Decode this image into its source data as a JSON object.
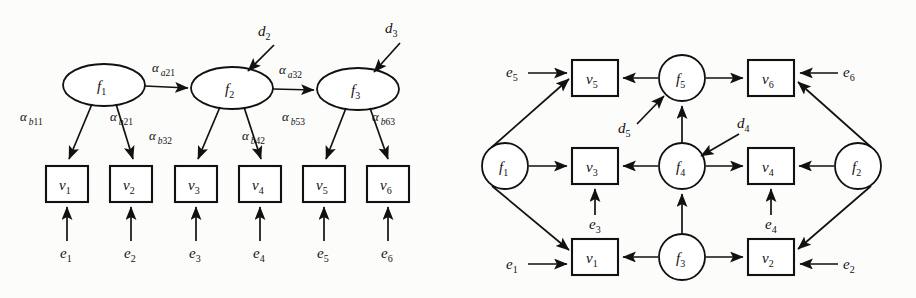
{
  "figure": {
    "background_color": "#fcfcfa",
    "stroke_color": "#111111",
    "node_fill": "#ffffff"
  },
  "left_panel": {
    "name": "factor-model-diagram",
    "latent_nodes": [
      {
        "id": "f1",
        "label": "f",
        "sub": "1",
        "shape": "ellipse",
        "cx": 104,
        "cy": 85,
        "rx": 41,
        "ry": 21
      },
      {
        "id": "f2",
        "label": "f",
        "sub": "2",
        "shape": "ellipse",
        "cx": 232,
        "cy": 88,
        "rx": 41,
        "ry": 21
      },
      {
        "id": "f3",
        "label": "f",
        "sub": "3",
        "shape": "ellipse",
        "cx": 358,
        "cy": 89,
        "rx": 41,
        "ry": 21
      }
    ],
    "observed_nodes": [
      {
        "id": "v1",
        "label": "v",
        "sub": "1",
        "shape": "rect",
        "x": 46,
        "y": 166,
        "w": 42,
        "h": 36
      },
      {
        "id": "v2",
        "label": "v",
        "sub": "2",
        "shape": "rect",
        "x": 110,
        "y": 166,
        "w": 42,
        "h": 36
      },
      {
        "id": "v3",
        "label": "v",
        "sub": "3",
        "shape": "rect",
        "x": 175,
        "y": 166,
        "w": 42,
        "h": 36
      },
      {
        "id": "v4",
        "label": "v",
        "sub": "4",
        "shape": "rect",
        "x": 239,
        "y": 166,
        "w": 42,
        "h": 36
      },
      {
        "id": "v5",
        "label": "v",
        "sub": "5",
        "shape": "rect",
        "x": 303,
        "y": 166,
        "w": 42,
        "h": 36
      },
      {
        "id": "v6",
        "label": "v",
        "sub": "6",
        "shape": "rect",
        "x": 367,
        "y": 166,
        "w": 42,
        "h": 36
      }
    ],
    "error_terms": [
      {
        "id": "e1",
        "label": "e",
        "sub": "1",
        "x": 67,
        "y": 258
      },
      {
        "id": "e2",
        "label": "e",
        "sub": "2",
        "x": 131,
        "y": 258
      },
      {
        "id": "e3",
        "label": "e",
        "sub": "3",
        "x": 196,
        "y": 258
      },
      {
        "id": "e4",
        "label": "e",
        "sub": "4",
        "x": 260,
        "y": 258
      },
      {
        "id": "e5",
        "label": "e",
        "sub": "5",
        "x": 324,
        "y": 258
      },
      {
        "id": "e6",
        "label": "e",
        "sub": "6",
        "x": 388,
        "y": 258
      }
    ],
    "disturbances": [
      {
        "id": "d2",
        "label": "d",
        "sub": "2",
        "x": 265,
        "y": 36
      },
      {
        "id": "d3",
        "label": "d",
        "sub": "3",
        "x": 392,
        "y": 33
      }
    ],
    "path_coefficients": [
      {
        "id": "a_a21",
        "symbol": "α",
        "sub_italic": "a",
        "sub_num": "21",
        "x": 160,
        "y": 72,
        "from": "f1",
        "to": "f2"
      },
      {
        "id": "a_a32",
        "symbol": "α",
        "sub_italic": "a",
        "sub_num": "32",
        "x": 287,
        "y": 74,
        "from": "f2",
        "to": "f3"
      },
      {
        "id": "a_b11",
        "symbol": "α",
        "sub_italic": "b",
        "sub_num": "11",
        "x": 28,
        "y": 121,
        "from": "f1",
        "to": "v1"
      },
      {
        "id": "a_b21",
        "symbol": "α",
        "sub_italic": "b",
        "sub_num": "21",
        "x": 118,
        "y": 121,
        "from": "f1",
        "to": "v2"
      },
      {
        "id": "a_b32",
        "symbol": "α",
        "sub_italic": "b",
        "sub_num": "32",
        "x": 157,
        "y": 140,
        "from": "f2",
        "to": "v3"
      },
      {
        "id": "a_b42",
        "symbol": "α",
        "sub_italic": "b",
        "sub_num": "42",
        "x": 250,
        "y": 140,
        "from": "f2",
        "to": "v4"
      },
      {
        "id": "a_b53",
        "symbol": "α",
        "sub_italic": "b",
        "sub_num": "53",
        "x": 290,
        "y": 121,
        "from": "f3",
        "to": "v5"
      },
      {
        "id": "a_b63",
        "symbol": "α",
        "sub_italic": "b",
        "sub_num": "63",
        "x": 380,
        "y": 121,
        "from": "f3",
        "to": "v6"
      }
    ]
  },
  "right_panel": {
    "name": "network-model-diagram",
    "latent_nodes": [
      {
        "id": "f1",
        "label": "f",
        "sub": "1",
        "shape": "circle",
        "cx": 505,
        "cy": 166,
        "r": 23
      },
      {
        "id": "f2",
        "label": "f",
        "sub": "2",
        "shape": "circle",
        "cx": 858,
        "cy": 166,
        "r": 23
      },
      {
        "id": "f3",
        "label": "f",
        "sub": "3",
        "shape": "circle",
        "cx": 682,
        "cy": 257,
        "r": 23
      },
      {
        "id": "f4",
        "label": "f",
        "sub": "4",
        "shape": "circle",
        "cx": 682,
        "cy": 166,
        "r": 23
      },
      {
        "id": "f5",
        "label": "f",
        "sub": "5",
        "shape": "circle",
        "cx": 682,
        "cy": 78,
        "r": 23
      }
    ],
    "observed_nodes": [
      {
        "id": "v5",
        "label": "v",
        "sub": "5",
        "shape": "rect",
        "x": 572,
        "y": 60,
        "w": 46,
        "h": 36
      },
      {
        "id": "v6",
        "label": "v",
        "sub": "6",
        "shape": "rect",
        "x": 748,
        "y": 60,
        "w": 46,
        "h": 36
      },
      {
        "id": "v3",
        "label": "v",
        "sub": "3",
        "shape": "rect",
        "x": 572,
        "y": 148,
        "w": 46,
        "h": 36
      },
      {
        "id": "v4",
        "label": "v",
        "sub": "4",
        "shape": "rect",
        "x": 748,
        "y": 148,
        "w": 46,
        "h": 36
      },
      {
        "id": "v1",
        "label": "v",
        "sub": "1",
        "shape": "rect",
        "x": 572,
        "y": 239,
        "w": 46,
        "h": 36
      },
      {
        "id": "v2",
        "label": "v",
        "sub": "2",
        "shape": "rect",
        "x": 748,
        "y": 239,
        "w": 46,
        "h": 36
      }
    ],
    "error_terms": [
      {
        "id": "e5",
        "label": "e",
        "sub": "5",
        "x": 512,
        "y": 73
      },
      {
        "id": "e6",
        "label": "e",
        "sub": "6",
        "x": 848,
        "y": 72
      },
      {
        "id": "e3",
        "label": "e",
        "sub": "3",
        "x": 595,
        "y": 225
      },
      {
        "id": "e4",
        "label": "e",
        "sub": "4",
        "x": 771,
        "y": 225
      },
      {
        "id": "e1",
        "label": "e",
        "sub": "1",
        "x": 512,
        "y": 264
      },
      {
        "id": "e2",
        "label": "e",
        "sub": "2",
        "x": 848,
        "y": 264
      }
    ],
    "disturbances": [
      {
        "id": "d5",
        "label": "d",
        "sub": "5",
        "x": 626,
        "y": 129
      },
      {
        "id": "d4",
        "label": "d",
        "sub": "4",
        "x": 742,
        "y": 124
      }
    ],
    "edges": [
      {
        "from": "e5",
        "to": "v5"
      },
      {
        "from": "f5",
        "to": "v5"
      },
      {
        "from": "f1",
        "to": "v5"
      },
      {
        "from": "f5",
        "to": "v6"
      },
      {
        "from": "e6",
        "to": "v6"
      },
      {
        "from": "f2",
        "to": "v6"
      },
      {
        "from": "d5",
        "to": "f5"
      },
      {
        "from": "f4",
        "to": "f5"
      },
      {
        "from": "f1",
        "to": "v3"
      },
      {
        "from": "f4",
        "to": "v3"
      },
      {
        "from": "e3",
        "to": "v3"
      },
      {
        "from": "f4",
        "to": "v4"
      },
      {
        "from": "f2",
        "to": "v4"
      },
      {
        "from": "e4",
        "to": "v4"
      },
      {
        "from": "d4",
        "to": "f4"
      },
      {
        "from": "f3",
        "to": "f4"
      },
      {
        "from": "e1",
        "to": "v1"
      },
      {
        "from": "f1",
        "to": "v1"
      },
      {
        "from": "f3",
        "to": "v1"
      },
      {
        "from": "f3",
        "to": "v2"
      },
      {
        "from": "e2",
        "to": "v2"
      },
      {
        "from": "f2",
        "to": "v2"
      }
    ]
  }
}
